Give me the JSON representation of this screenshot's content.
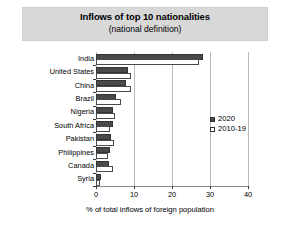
{
  "chart_data": {
    "type": "bar",
    "orientation": "horizontal",
    "title": "Inflows of top 10 nationalities",
    "subtitle": "(national definition)",
    "xlabel": "% of total inflows of foreign population",
    "ylabel": "",
    "xlim": [
      0,
      40
    ],
    "xticks": [
      0,
      10,
      20,
      30,
      40
    ],
    "xtick_labels": [
      "0",
      "10",
      "20",
      "30",
      "40"
    ],
    "grid": true,
    "grid_axis": "x",
    "legend_position": "right-center",
    "categories": [
      "India",
      "United States",
      "China",
      "Brazil",
      "Nigeria",
      "South Africa",
      "Pakistan",
      "Philippines",
      "Canada",
      "Syria"
    ],
    "series": [
      {
        "name": "2020",
        "color": "#4a4a4a",
        "style": "filled",
        "values": [
          28.2,
          8.4,
          7.9,
          5.2,
          4.6,
          4.4,
          4.0,
          3.8,
          3.4,
          1.4
        ]
      },
      {
        "name": "2010-19",
        "color": "#ffffff",
        "style": "open",
        "values": [
          27.0,
          9.2,
          9.2,
          6.6,
          5.0,
          3.6,
          4.8,
          3.2,
          4.6,
          1.1
        ]
      }
    ]
  },
  "legend": {
    "entries": [
      {
        "label": "2020",
        "swatch": "filled-square"
      },
      {
        "label": "2010-19",
        "swatch": "open-square"
      }
    ]
  }
}
